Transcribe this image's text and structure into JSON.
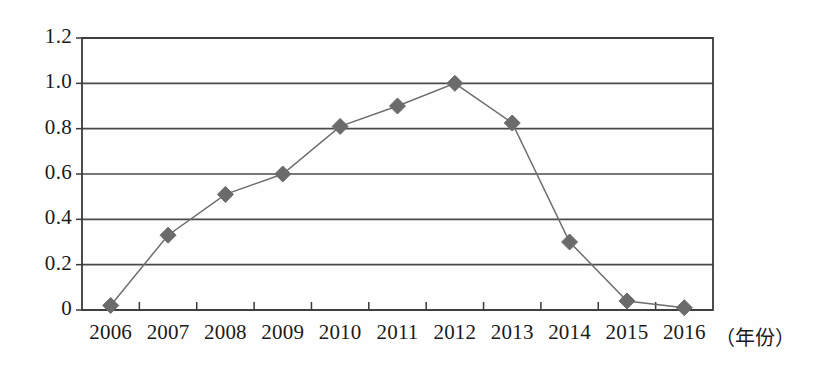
{
  "chart_data": {
    "type": "line",
    "title": "",
    "xlabel": "（年份）",
    "ylabel": "",
    "x": [
      2006,
      2007,
      2008,
      2009,
      2010,
      2011,
      2012,
      2013,
      2014,
      2015,
      2016
    ],
    "categories": [
      "2006",
      "2007",
      "2008",
      "2009",
      "2010",
      "2011",
      "2012",
      "2013",
      "2014",
      "2015",
      "2016"
    ],
    "values": [
      0.02,
      0.33,
      0.51,
      0.6,
      0.81,
      0.9,
      1.0,
      0.825,
      0.3,
      0.04,
      0.01
    ],
    "series": [
      {
        "name": "",
        "values": [
          0.02,
          0.33,
          0.51,
          0.6,
          0.81,
          0.9,
          1.0,
          0.825,
          0.3,
          0.04,
          0.01
        ],
        "marker": "diamond",
        "marker_color": "#6b6b6b",
        "line_color": "#6e6e6e"
      }
    ],
    "ylim": [
      0,
      1.2
    ],
    "yticks": [
      0,
      0.2,
      0.4,
      0.6,
      0.8,
      1.0,
      1.2
    ],
    "ytick_labels": [
      "0",
      "0.2",
      "0.4",
      "0.6",
      "0.8",
      "1.0",
      "1.2"
    ],
    "xtick_labels": [
      "2006",
      "2007",
      "2008",
      "2009",
      "2010",
      "2011",
      "2012",
      "2013",
      "2014",
      "2015",
      "2016"
    ],
    "grid": "horizontal",
    "legend": "none",
    "plot_border": true,
    "colors": {
      "axis": "#3a3a3a",
      "grid": "#4a4a4a",
      "line": "#6e6e6e",
      "marker": "#6b6b6b",
      "text": "#1a1a1a",
      "background": "#fefefe"
    }
  }
}
